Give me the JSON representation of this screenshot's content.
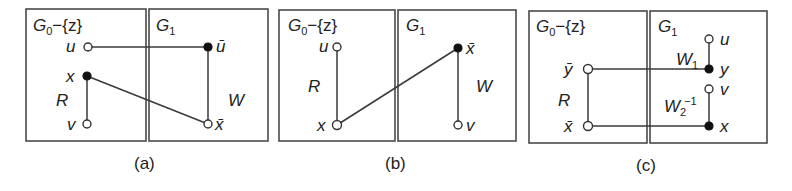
{
  "panels": [
    {
      "caption": "(a)",
      "left_box": {
        "title": "G",
        "title_sub": "0",
        "title_rest": "−{z}"
      },
      "right_box": {
        "title": "G",
        "title_sub": "1"
      },
      "path_labels": {
        "left": "R",
        "right": "W"
      },
      "nodes": [
        {
          "id": "u",
          "label": "u",
          "filled": false
        },
        {
          "id": "x",
          "label": "x",
          "filled": true
        },
        {
          "id": "v",
          "label": "v",
          "filled": false
        },
        {
          "id": "u_bar",
          "label": "ū",
          "filled": true
        },
        {
          "id": "x_bar",
          "label": "x̄",
          "filled": false
        }
      ],
      "edges": [
        [
          "u",
          "u_bar"
        ],
        [
          "x",
          "v"
        ],
        [
          "x",
          "x_bar"
        ],
        [
          "u_bar",
          "x_bar"
        ]
      ]
    },
    {
      "caption": "(b)",
      "left_box": {
        "title": "G",
        "title_sub": "0",
        "title_rest": "−{z}"
      },
      "right_box": {
        "title": "G",
        "title_sub": "1"
      },
      "path_labels": {
        "left": "R",
        "right": "W"
      },
      "nodes": [
        {
          "id": "u",
          "label": "u",
          "filled": false
        },
        {
          "id": "x",
          "label": "x",
          "filled": false
        },
        {
          "id": "x_bar",
          "label": "x̄",
          "filled": true
        },
        {
          "id": "v",
          "label": "v",
          "filled": false
        }
      ],
      "edges": [
        [
          "u",
          "x"
        ],
        [
          "x",
          "x_bar"
        ],
        [
          "x_bar",
          "v"
        ]
      ]
    },
    {
      "caption": "(c)",
      "left_box": {
        "title": "G",
        "title_sub": "0",
        "title_rest": "−{z}"
      },
      "right_box": {
        "title": "G",
        "title_sub": "1"
      },
      "path_labels": {
        "left": "R",
        "right_top": "W",
        "right_top_sub": "1",
        "right_bottom": "W",
        "right_bottom_sub": "2",
        "right_bottom_sup": "−1"
      },
      "nodes": [
        {
          "id": "y_bar",
          "label": "ȳ",
          "filled": false
        },
        {
          "id": "x_bar",
          "label": "x̄",
          "filled": false
        },
        {
          "id": "u",
          "label": "u",
          "filled": false
        },
        {
          "id": "y",
          "label": "y",
          "filled": true
        },
        {
          "id": "v",
          "label": "v",
          "filled": false
        },
        {
          "id": "x",
          "label": "x",
          "filled": true
        }
      ],
      "edges": [
        [
          "y_bar",
          "x_bar"
        ],
        [
          "y_bar",
          "y"
        ],
        [
          "x_bar",
          "x"
        ],
        [
          "u",
          "y"
        ],
        [
          "v",
          "x"
        ]
      ]
    }
  ]
}
